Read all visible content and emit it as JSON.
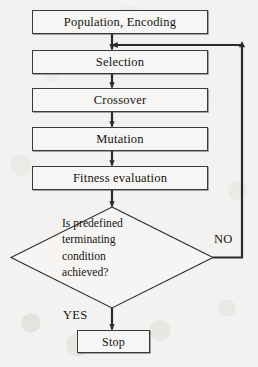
{
  "diagram": {
    "background_color": "#f3f2f0",
    "line_color": "#2b2b2b",
    "text_color": "#15120f",
    "nodes": {
      "population": {
        "label": "Population, Encoding",
        "shape": "process"
      },
      "selection": {
        "label": "Selection",
        "shape": "process"
      },
      "crossover": {
        "label": "Crossover",
        "shape": "process"
      },
      "mutation": {
        "label": "Mutation",
        "shape": "process"
      },
      "fitness": {
        "label": "Fitness evaluation",
        "shape": "process"
      },
      "decision": {
        "shape": "diamond",
        "lines": [
          "Is predefined",
          "terminating",
          "condition",
          "achieved?"
        ],
        "text": "Is predefined terminating condition achieved?"
      },
      "stop": {
        "label": "Stop",
        "shape": "terminator"
      }
    },
    "edge_labels": {
      "no": "NO",
      "yes": "YES"
    }
  }
}
